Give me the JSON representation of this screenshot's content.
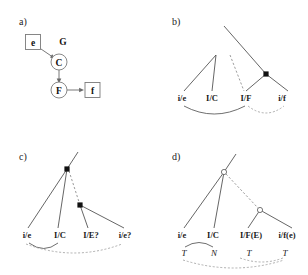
{
  "figure": {
    "width": 308,
    "height": 275,
    "background": "#ffffff",
    "ink": "#1a1a1a",
    "line_gray": "#4a4a4a",
    "dash_gray": "#9a9a9a"
  },
  "panels": [
    {
      "id": "a",
      "label": "a)",
      "type": "graph",
      "nodes": [
        {
          "id": "e",
          "label": "e",
          "shape": "box",
          "x": 33,
          "y": 42
        },
        {
          "id": "G",
          "label": "G",
          "shape": "none",
          "x": 63,
          "y": 41
        },
        {
          "id": "C",
          "label": "C",
          "shape": "circle",
          "x": 59,
          "y": 62
        },
        {
          "id": "F",
          "label": "F",
          "shape": "circle",
          "x": 59,
          "y": 90
        },
        {
          "id": "f",
          "label": "f",
          "shape": "box",
          "x": 92,
          "y": 90
        }
      ],
      "edges": [
        {
          "from": "e",
          "to": "C",
          "style": "arrow"
        },
        {
          "from": "C",
          "to": "F",
          "style": "arrow"
        },
        {
          "from": "F",
          "to": "f",
          "style": "arrow"
        }
      ]
    },
    {
      "id": "b",
      "label": "b)",
      "type": "tree",
      "leaves": [
        "i/e",
        "I/C",
        "I/F",
        "i/f"
      ],
      "subscripts": [],
      "internal_nodes": [
        {
          "marker": "filled",
          "x": 266,
          "y": 74
        }
      ],
      "links": [
        {
          "from": "i/e",
          "to": "I/F",
          "style": "solid"
        },
        {
          "from": "I/F",
          "to": "i/f",
          "style": "dashed"
        }
      ]
    },
    {
      "id": "c",
      "label": "c)",
      "type": "tree",
      "leaves": [
        "i/e",
        "I/C",
        "I/E?",
        "i/e?"
      ],
      "subscripts": [],
      "internal_nodes": [
        {
          "marker": "filled",
          "x": 67,
          "y": 169
        },
        {
          "marker": "filled",
          "x": 80,
          "y": 205
        }
      ],
      "links": [
        {
          "from": "i/e",
          "to": "I/C",
          "style": "solid"
        },
        {
          "from": "i/e",
          "to": "i/e?",
          "style": "dashed"
        }
      ]
    },
    {
      "id": "d",
      "label": "d)",
      "type": "tree",
      "leaves": [
        "i/e",
        "I/C",
        "I/F(E)",
        "i/f(e)"
      ],
      "subscripts": [
        "T",
        "N",
        "T",
        "T"
      ],
      "internal_nodes": [
        {
          "marker": "open",
          "x": 224,
          "y": 172
        },
        {
          "marker": "open",
          "x": 260,
          "y": 210
        }
      ],
      "links": [
        {
          "from": "T",
          "to": "N",
          "style": "solid"
        },
        {
          "from": "T",
          "to": "T",
          "style": "dashed"
        }
      ]
    }
  ]
}
